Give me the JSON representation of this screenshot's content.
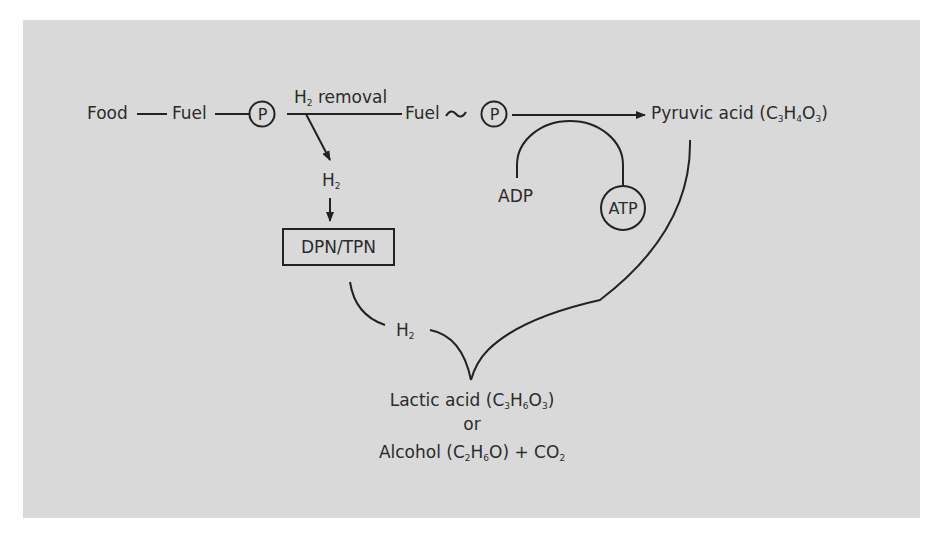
{
  "diagram": {
    "type": "metabolic pathway (glycolysis / fermentation)",
    "colors": {
      "background_panel": "#d9d9d9",
      "ink": "#222222"
    },
    "nodes": {
      "food": "Food",
      "fuel1": "Fuel",
      "phosphate1": "P",
      "h2_removal": {
        "prefix": "H",
        "sub": "2",
        "suffix": " removal"
      },
      "fuel2": "Fuel",
      "tilde": "~",
      "phosphate2": "P",
      "pyruvic": {
        "name": "Pyruvic acid (C",
        "c": "3",
        "h_label": "H",
        "h": "4",
        "o_label": "O",
        "o": "3",
        "close": ")"
      },
      "h2_branch": {
        "prefix": "H",
        "sub": "2"
      },
      "dpn_tpn": "DPN/TPN",
      "adp": "ADP",
      "atp": "ATP",
      "h2_return": {
        "prefix": "H",
        "sub": "2"
      },
      "lactic": {
        "name": "Lactic acid (C",
        "c": "3",
        "h_label": "H",
        "h": "6",
        "o_label": "O",
        "o": "3",
        "close": ")"
      },
      "or": "or",
      "alcohol": {
        "name": "Alcohol (C",
        "c": "2",
        "h_label": "H",
        "h": "6",
        "tail": "O) + CO",
        "co": "2"
      }
    },
    "edges": [
      {
        "from": "Food",
        "to": "Fuel"
      },
      {
        "from": "Fuel",
        "to": "P"
      },
      {
        "from": "P",
        "to": "Fuel~P",
        "label": "H2 removal"
      },
      {
        "from": "H2 removal",
        "to": "H2",
        "arrow": true
      },
      {
        "from": "H2",
        "to": "DPN/TPN",
        "arrow": true
      },
      {
        "from": "Fuel~P",
        "to": "Pyruvic acid (C3H4O3)",
        "arrow": true
      },
      {
        "from": "ADP",
        "to": "ATP",
        "curve": "arch"
      },
      {
        "from": "DPN/TPN",
        "to": "H2"
      },
      {
        "from": "H2 + Pyruvic acid",
        "to": "Lactic acid (C3H6O3) or Alcohol (C2H6O) + CO2"
      }
    ]
  }
}
